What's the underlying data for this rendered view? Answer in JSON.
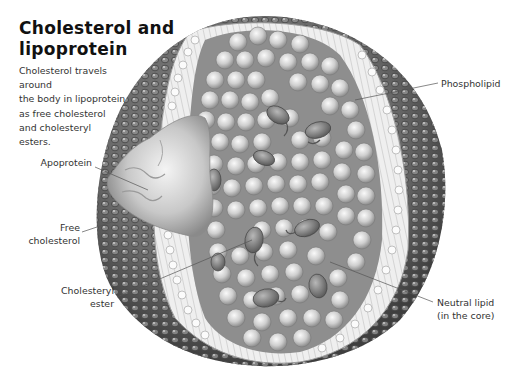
{
  "title": {
    "line1": "Cholesterol and",
    "line2": "lipoprotein"
  },
  "description": {
    "lines": [
      "Cholesterol travels around",
      "the body in lipoprotein",
      "as free cholesterol",
      "and cholesteryl",
      "esters."
    ]
  },
  "labels": {
    "apoprotein": "Apoprotein",
    "free_cholesterol": {
      "line1": "Free",
      "line2": "cholesterol"
    },
    "cholesteryl_ester": {
      "line1": "Cholesteryl",
      "line2": "ester"
    },
    "phospholipid": "Phospholipid",
    "neutral_lipid": {
      "line1": "Neutral lipid",
      "line2": "(in the core)"
    }
  },
  "colors": {
    "background": "#ffffff",
    "outer_shell": "#6e6e6e",
    "bilayer": "#e8e8e8",
    "core_sphere": "#d4d4d4",
    "ester": "#8a8a8a",
    "text": "#333333"
  }
}
